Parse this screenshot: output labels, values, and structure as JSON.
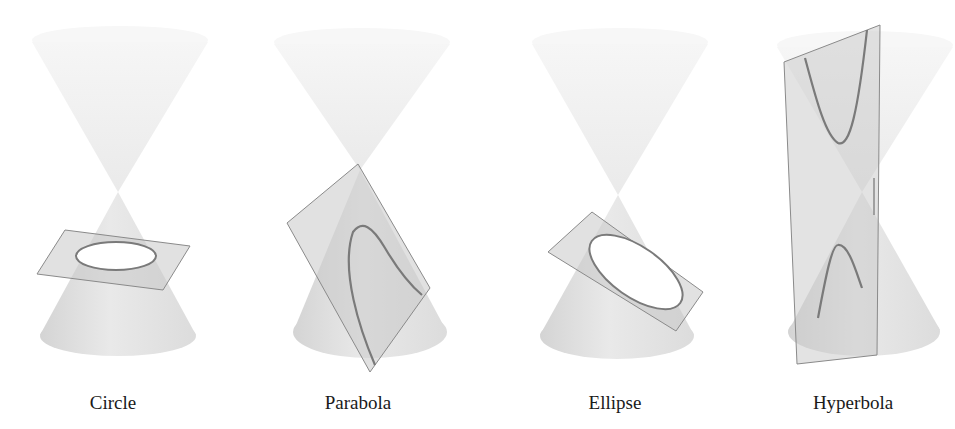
{
  "diagram": {
    "colors": {
      "background": "#ffffff",
      "cone_upper": "#ececec",
      "cone_lower": "#d8d8d8",
      "plane_fill": "#c8c8c8",
      "plane_edge": "#8a8a8a",
      "curve": "#7a7a7a",
      "label": "#1a1a1a"
    },
    "panels": [
      {
        "id": "circle",
        "label": "Circle",
        "label_x": 113
      },
      {
        "id": "parabola",
        "label": "Parabola",
        "label_x": 358
      },
      {
        "id": "ellipse",
        "label": "Ellipse",
        "label_x": 615
      },
      {
        "id": "hyperbola",
        "label": "Hyperbola",
        "label_x": 853
      }
    ]
  }
}
